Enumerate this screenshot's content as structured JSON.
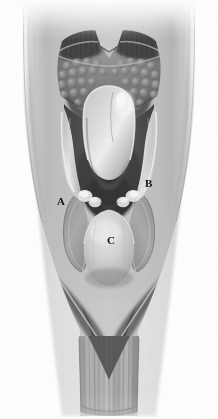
{
  "figure": {
    "kind": "anatomical-illustration",
    "style": "grayscale pencil/airbrush medical illustration",
    "view": "superior view (laryngoscopic / mirror view)",
    "canvas": {
      "width": 218,
      "height": 419
    },
    "background_color": "#ffffff"
  },
  "palette": {
    "background": "#ffffff",
    "label_text": "#111111",
    "tissue_light": "#e4e4e4",
    "tissue_mid": "#b6b6b6",
    "tissue_mid_dark": "#8e8e8e",
    "tissue_dark": "#6a6a6a",
    "cavity_dark": "#4a4a4a",
    "cavity_darkest": "#2f2f2f",
    "highlight": "#f2f2f2",
    "outline": "#5a5a5a"
  },
  "labels": [
    {
      "id": "A",
      "text": "A",
      "x": 57,
      "y": 196,
      "structure": "left pyriform sinus / lateral pharyngeal wall"
    },
    {
      "id": "B",
      "text": "B",
      "x": 145,
      "y": 178,
      "structure": "right pyriform sinus / aryepiglottic region"
    },
    {
      "id": "C",
      "text": "C",
      "x": 107,
      "y": 235,
      "structure": "postcricoid region"
    }
  ],
  "regions": [
    {
      "name": "tongue-base-lingual-tonsil",
      "description": "bumpy follicular lingual tonsil tissue at top"
    },
    {
      "name": "vallecula",
      "description": "dark trough between tongue base and epiglottis"
    },
    {
      "name": "epiglottis",
      "description": "pale rounded midline structure"
    },
    {
      "name": "aryepiglottic-folds",
      "description": "pale curved folds flanking the laryngeal inlet"
    },
    {
      "name": "laryngeal-inlet",
      "description": "dark central aperture"
    },
    {
      "name": "pyriform-sinuses",
      "description": "elongated ovoid recesses left and right"
    },
    {
      "name": "postcricoid-mound",
      "description": "rounded pale bulge inferiorly"
    },
    {
      "name": "cervical-esophagus",
      "description": "vertical striated tube at the bottom"
    },
    {
      "name": "lateral-pharyngeal-walls",
      "description": "smooth shaded walls forming the outer funnel"
    }
  ]
}
